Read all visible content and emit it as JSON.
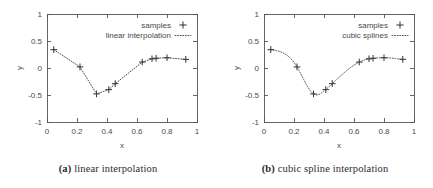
{
  "figure": {
    "background": "#ffffff",
    "axis_color": "#555555",
    "data_color": "#3a3a3a",
    "text_color": "#4a4a4a",
    "caption_color": "#2b2b2b"
  },
  "panels": [
    {
      "id": "a",
      "caption_tag": "(a)",
      "caption_text": "linear interpolation",
      "chart_data": {
        "type": "scatter",
        "title": "",
        "xlabel": "x",
        "ylabel": "y",
        "xlim": [
          0,
          1
        ],
        "ylim": [
          -1,
          1
        ],
        "xticks": [
          "0",
          "0.2",
          "0.4",
          "0.6",
          "0.8",
          "1"
        ],
        "xtick_values": [
          0,
          0.2,
          0.4,
          0.6,
          0.8,
          1
        ],
        "yticks": [
          "-1",
          "-0.5",
          "0",
          "0.5",
          "1"
        ],
        "ytick_values": [
          -1,
          -0.5,
          0,
          0.5,
          1
        ],
        "grid": false,
        "legend_position": "top-right",
        "legend": [
          {
            "label": "samples",
            "marker": "plus",
            "line": "none"
          },
          {
            "label": "linear interpolation",
            "marker": "none",
            "line": "dotted"
          }
        ],
        "series": [
          {
            "name": "samples",
            "marker": "plus",
            "x": [
              0.045,
              0.22,
              0.33,
              0.412,
              0.455,
              0.635,
              0.7,
              0.727,
              0.8,
              0.925
            ],
            "y": [
              0.34,
              0.02,
              -0.48,
              -0.4,
              -0.29,
              0.11,
              0.17,
              0.18,
              0.19,
              0.16
            ]
          },
          {
            "name": "linear interpolation",
            "interpolation": "linear",
            "line": "dotted",
            "x": [
              0.045,
              0.22,
              0.33,
              0.412,
              0.455,
              0.635,
              0.7,
              0.727,
              0.8,
              0.925
            ],
            "y": [
              0.34,
              0.02,
              -0.48,
              -0.4,
              -0.29,
              0.11,
              0.17,
              0.18,
              0.19,
              0.16
            ]
          }
        ]
      }
    },
    {
      "id": "b",
      "caption_tag": "(b)",
      "caption_text": "cubic spline interpolation",
      "chart_data": {
        "type": "scatter",
        "title": "",
        "xlabel": "x",
        "ylabel": "y",
        "xlim": [
          0,
          1
        ],
        "ylim": [
          -1,
          1
        ],
        "xticks": [
          "0",
          "0.2",
          "0.4",
          "0.6",
          "0.8",
          "1"
        ],
        "xtick_values": [
          0,
          0.2,
          0.4,
          0.6,
          0.8,
          1
        ],
        "yticks": [
          "-1",
          "-0.5",
          "0",
          "0.5",
          "1"
        ],
        "ytick_values": [
          -1,
          -0.5,
          0,
          0.5,
          1
        ],
        "grid": false,
        "legend_position": "top-right",
        "legend": [
          {
            "label": "samples",
            "marker": "plus",
            "line": "none"
          },
          {
            "label": "cubic splines",
            "marker": "none",
            "line": "dotted"
          }
        ],
        "series": [
          {
            "name": "samples",
            "marker": "plus",
            "x": [
              0.045,
              0.22,
              0.33,
              0.412,
              0.455,
              0.635,
              0.7,
              0.727,
              0.8,
              0.925
            ],
            "y": [
              0.34,
              0.02,
              -0.48,
              -0.4,
              -0.29,
              0.11,
              0.17,
              0.18,
              0.19,
              0.16
            ]
          },
          {
            "name": "cubic splines",
            "interpolation": "cubic-spline",
            "line": "dotted",
            "x": [
              0.045,
              0.22,
              0.33,
              0.412,
              0.455,
              0.635,
              0.7,
              0.727,
              0.8,
              0.925
            ],
            "y": [
              0.34,
              0.02,
              -0.48,
              -0.4,
              -0.29,
              0.11,
              0.17,
              0.18,
              0.19,
              0.16
            ]
          }
        ]
      }
    }
  ]
}
